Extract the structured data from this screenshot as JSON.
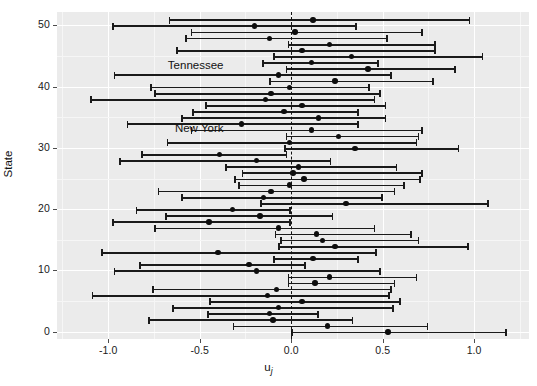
{
  "axes": {
    "x_title": "u",
    "x_title_sub": "j",
    "y_title": "State",
    "x_ticks": [
      {
        "value": -1.0,
        "label": "-1.0"
      },
      {
        "value": -0.5,
        "label": "-0.5"
      },
      {
        "value": 0.0,
        "label": "0.0"
      },
      {
        "value": 0.5,
        "label": "0.5"
      },
      {
        "value": 1.0,
        "label": "1.0"
      }
    ],
    "y_ticks": [
      {
        "value": 0,
        "label": "0"
      },
      {
        "value": 10,
        "label": "10"
      },
      {
        "value": 20,
        "label": "20"
      },
      {
        "value": 30,
        "label": "30"
      },
      {
        "value": 40,
        "label": "40"
      },
      {
        "value": 50,
        "label": "50"
      }
    ]
  },
  "annotations": [
    {
      "name": "Tennessee",
      "y": 43.2,
      "x_right": -0.37
    },
    {
      "name": "New York",
      "y": 33.0,
      "x_right": -0.37
    }
  ],
  "reference_line": {
    "value": 0.0,
    "style": "dashed",
    "color": "#111111"
  },
  "colors": {
    "panel_background": "#ebebeb",
    "gridline_major": "#ffffff",
    "gridline_minor": "#f6f6f6",
    "point": "#0d0d0d",
    "interval": "#1a1a1a",
    "reference": "#111111",
    "text": "#1a1a1a"
  },
  "chart_data": {
    "type": "scatter",
    "title": "",
    "subtitle": "",
    "xlabel": "u_j",
    "ylabel": "State",
    "xlim": [
      -1.28,
      1.3
    ],
    "ylim": [
      -1.2,
      52.2
    ],
    "grid": true,
    "legend": null,
    "plot_style": "caterpillar / random-effects interval plot",
    "reference_line_x": 0.0,
    "series": [
      {
        "name": "Random effect estimate with 95% interval",
        "y": "State index (0-51)",
        "x": "u_j posterior estimate",
        "points": [
          {
            "state_index": 51,
            "estimate": 0.12,
            "lower": -0.67,
            "upper": 0.98
          },
          {
            "state_index": 50,
            "estimate": -0.2,
            "lower": -0.98,
            "upper": 0.36
          },
          {
            "state_index": 49,
            "estimate": 0.02,
            "lower": -0.55,
            "upper": 0.72
          },
          {
            "state_index": 48,
            "estimate": -0.12,
            "lower": -0.58,
            "upper": 0.53
          },
          {
            "state_index": 47,
            "estimate": 0.21,
            "lower": -0.02,
            "upper": 0.79
          },
          {
            "state_index": 46,
            "estimate": 0.06,
            "lower": -0.63,
            "upper": 0.79
          },
          {
            "state_index": 45,
            "estimate": 0.33,
            "lower": -0.1,
            "upper": 1.05
          },
          {
            "state_index": 44,
            "estimate": 0.11,
            "lower": -0.16,
            "upper": 0.48
          },
          {
            "state_index": 43,
            "estimate": 0.42,
            "lower": -0.03,
            "upper": 0.9
          },
          {
            "state_index": 42,
            "estimate": -0.07,
            "lower": -0.97,
            "upper": 0.55
          },
          {
            "state_index": 41,
            "estimate": 0.24,
            "lower": -0.12,
            "upper": 0.78
          },
          {
            "state_index": 40,
            "estimate": -0.01,
            "lower": -0.77,
            "upper": 0.43
          },
          {
            "state_index": 39,
            "estimate": -0.11,
            "lower": -0.75,
            "upper": 0.49
          },
          {
            "state_index": 38,
            "estimate": -0.14,
            "lower": -1.1,
            "upper": 0.46
          },
          {
            "state_index": 37,
            "estimate": 0.06,
            "lower": -0.47,
            "upper": 0.52
          },
          {
            "state_index": 36,
            "estimate": -0.04,
            "lower": -0.54,
            "upper": 0.37
          },
          {
            "state_index": 35,
            "estimate": 0.15,
            "lower": -0.6,
            "upper": 0.52
          },
          {
            "state_index": 34,
            "estimate": -0.27,
            "lower": -0.9,
            "upper": 0.37
          },
          {
            "state_index": 33,
            "estimate": 0.11,
            "lower": -0.55,
            "upper": 0.72
          },
          {
            "state_index": 32,
            "estimate": 0.26,
            "lower": -0.03,
            "upper": 0.7
          },
          {
            "state_index": 31,
            "estimate": -0.01,
            "lower": -0.68,
            "upper": 0.69
          },
          {
            "state_index": 30,
            "estimate": 0.35,
            "lower": -0.04,
            "upper": 0.92
          },
          {
            "state_index": 29,
            "estimate": -0.39,
            "lower": -0.82,
            "upper": -0.02
          },
          {
            "state_index": 28,
            "estimate": -0.19,
            "lower": -0.94,
            "upper": 0.22
          },
          {
            "state_index": 27,
            "estimate": 0.04,
            "lower": -0.36,
            "upper": 0.58
          },
          {
            "state_index": 26,
            "estimate": 0.01,
            "lower": -0.27,
            "upper": 0.72
          },
          {
            "state_index": 25,
            "estimate": 0.07,
            "lower": -0.31,
            "upper": 0.71
          },
          {
            "state_index": 24,
            "estimate": -0.01,
            "lower": -0.29,
            "upper": 0.62
          },
          {
            "state_index": 23,
            "estimate": -0.11,
            "lower": -0.73,
            "upper": 0.57
          },
          {
            "state_index": 22,
            "estimate": -0.15,
            "lower": -0.6,
            "upper": 0.5
          },
          {
            "state_index": 21,
            "estimate": 0.3,
            "lower": -0.17,
            "upper": 1.08
          },
          {
            "state_index": 20,
            "estimate": -0.32,
            "lower": -0.85,
            "upper": 0.0
          },
          {
            "state_index": 19,
            "estimate": -0.17,
            "lower": -0.69,
            "upper": 0.23
          },
          {
            "state_index": 18,
            "estimate": -0.45,
            "lower": -0.98,
            "upper": 0.0
          },
          {
            "state_index": 17,
            "estimate": -0.07,
            "lower": -0.75,
            "upper": 0.46
          },
          {
            "state_index": 16,
            "estimate": 0.14,
            "lower": -0.09,
            "upper": 0.66
          },
          {
            "state_index": 15,
            "estimate": 0.17,
            "lower": -0.06,
            "upper": 0.7
          },
          {
            "state_index": 14,
            "estimate": 0.24,
            "lower": -0.07,
            "upper": 0.97
          },
          {
            "state_index": 13,
            "estimate": -0.4,
            "lower": -1.04,
            "upper": 0.47
          },
          {
            "state_index": 12,
            "estimate": 0.12,
            "lower": -0.1,
            "upper": 0.37
          },
          {
            "state_index": 11,
            "estimate": -0.23,
            "lower": -0.83,
            "upper": 0.08
          },
          {
            "state_index": 10,
            "estimate": -0.19,
            "lower": -0.97,
            "upper": 0.49
          },
          {
            "state_index": 9,
            "estimate": 0.21,
            "lower": -0.02,
            "upper": 0.69
          },
          {
            "state_index": 8,
            "estimate": 0.13,
            "lower": -0.02,
            "upper": 0.57
          },
          {
            "state_index": 7,
            "estimate": -0.08,
            "lower": -0.76,
            "upper": 0.55
          },
          {
            "state_index": 6,
            "estimate": -0.13,
            "lower": -1.09,
            "upper": 0.54
          },
          {
            "state_index": 5,
            "estimate": 0.06,
            "lower": -0.45,
            "upper": 0.6
          },
          {
            "state_index": 4,
            "estimate": -0.07,
            "lower": -0.65,
            "upper": 0.56
          },
          {
            "state_index": 3,
            "estimate": -0.12,
            "lower": -0.46,
            "upper": 0.15
          },
          {
            "state_index": 2,
            "estimate": -0.1,
            "lower": -0.78,
            "upper": 0.34
          },
          {
            "state_index": 1,
            "estimate": 0.2,
            "lower": -0.32,
            "upper": 0.75
          },
          {
            "state_index": 0,
            "estimate": 0.53,
            "lower": 0.0,
            "upper": 1.18
          }
        ]
      }
    ]
  }
}
